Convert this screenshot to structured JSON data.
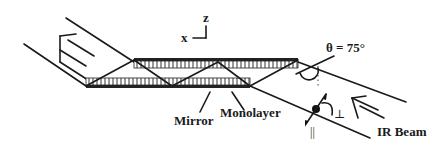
{
  "diagram": {
    "type": "schematic",
    "axes": {
      "z_label": "z",
      "x_label": "x"
    },
    "angle_label": "θ = 75°",
    "labels": {
      "mirror": "Mirror",
      "monolayer": "Monolayer",
      "ir_beam": "IR Beam",
      "perpendicular": "⊥",
      "parallel": "||"
    },
    "colors": {
      "ink": "#1a1a1a",
      "background": "#ffffff",
      "hatch": "#555555"
    }
  }
}
